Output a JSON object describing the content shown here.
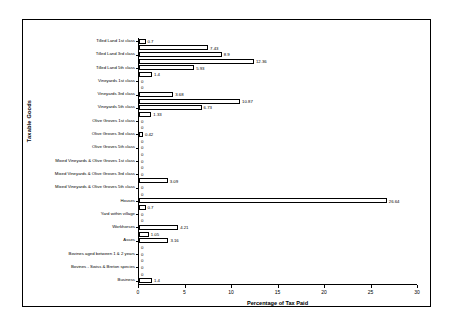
{
  "chart_data": {
    "type": "bar",
    "orientation": "horizontal",
    "title": "",
    "xlabel": "Percentage of Tax Paid",
    "ylabel": "Taxable Goods",
    "xlim": [
      0,
      30
    ],
    "xticks": [
      0,
      5,
      10,
      15,
      20,
      25,
      30
    ],
    "grid": false,
    "legend": null,
    "categories": [
      "Business",
      "",
      "Bovines - Swiss & Breton species",
      "",
      "Bovines aged between 1 & 2 years",
      "",
      "Asses",
      "",
      "Workhorses",
      "",
      "Yard within village",
      "",
      "Houses",
      "",
      "Mixed Vineyards & Olive Groves 5th class",
      "",
      "Mixed Vineyards & Olive Groves 3rd class",
      "",
      "Mixed Vineyards & Olive Groves 1st class",
      "",
      "Olive Groves 5th class",
      "",
      "Olive Groves 3rd class",
      "",
      "Olive Groves 1st class",
      "",
      "Vineyards 5th class",
      "",
      "Vineyards 3rd class",
      "",
      "Vineyards 1st class",
      "",
      "Tilled Land 5th class",
      "",
      "Tilled Land 3rd class",
      "",
      "Tilled Land 1st class"
    ],
    "values": [
      1.4,
      0,
      0,
      0,
      0,
      0,
      3.16,
      1.05,
      4.21,
      0,
      0,
      0.7,
      26.64,
      0,
      0,
      3.09,
      0,
      0,
      0,
      0,
      0,
      0,
      0.42,
      0,
      0,
      1.33,
      6.73,
      10.87,
      3.68,
      0,
      0,
      1.4,
      5.93,
      12.36,
      8.9,
      7.43,
      0.7
    ],
    "value_labels": [
      "1.4",
      "0",
      "0",
      "0",
      "0",
      "0",
      "3.16",
      "1.05",
      "4.21",
      "0",
      "0",
      "0.7",
      "26.64",
      "0",
      "0",
      "3.09",
      "0",
      "0",
      "0",
      "0",
      "0",
      "0",
      "0.42",
      "0",
      "0",
      "1.33",
      "6.73",
      "10.87",
      "3.68",
      "0",
      "0",
      "1.4",
      "5.93",
      "12.36",
      "8.9",
      "7.43",
      "0.7"
    ],
    "colors": {
      "bar_fill": "#ffffff",
      "bar_edge": "#000000",
      "axis": "#000000",
      "text": "#000000",
      "background": "#ffffff"
    }
  }
}
